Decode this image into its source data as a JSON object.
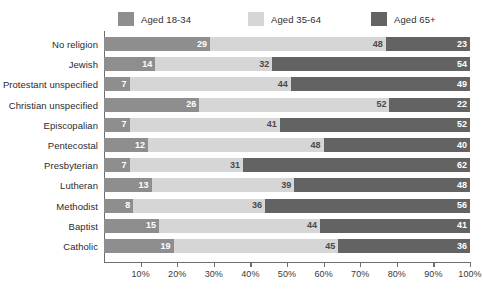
{
  "chart_data": {
    "type": "bar",
    "orientation": "horizontal",
    "stacked": true,
    "title": "",
    "subtitle": "",
    "xlabel": "",
    "ylabel": "",
    "xlim": [
      0,
      100
    ],
    "grid": true,
    "legend_position": "top",
    "categories": [
      "No religion",
      "Jewish",
      "Protestant unspecified",
      "Christian unspecified",
      "Episcopalian",
      "Pentecostal",
      "Presbyterian",
      "Lutheran",
      "Methodist",
      "Baptist",
      "Catholic"
    ],
    "series": [
      {
        "name": "Aged 18-34",
        "color": "#8e8e8e",
        "values": [
          29,
          14,
          7,
          26,
          7,
          12,
          7,
          13,
          8,
          15,
          19
        ]
      },
      {
        "name": "Aged 35-64",
        "color": "#d6d6d6",
        "values": [
          48,
          32,
          44,
          52,
          41,
          48,
          31,
          39,
          36,
          44,
          45
        ]
      },
      {
        "name": "Aged 65+",
        "color": "#636363",
        "values": [
          23,
          54,
          49,
          22,
          52,
          40,
          62,
          48,
          56,
          41,
          36
        ]
      }
    ],
    "xticks": [
      10,
      20,
      30,
      40,
      50,
      60,
      70,
      80,
      90,
      100
    ],
    "xtick_labels": [
      "10%",
      "20%",
      "30%",
      "40%",
      "50%",
      "60%",
      "70%",
      "80%",
      "90%",
      "100%"
    ]
  },
  "legend": {
    "items": [
      {
        "label": "Aged 18-34",
        "color": "#8e8e8e"
      },
      {
        "label": "Aged 35-64",
        "color": "#d6d6d6"
      },
      {
        "label": "Aged 65+",
        "color": "#636363"
      }
    ]
  },
  "colors": {
    "background": "#ffffff",
    "axis": "#6e6e6e",
    "gridline": "#ffffff",
    "text": "#2b2b2b"
  }
}
